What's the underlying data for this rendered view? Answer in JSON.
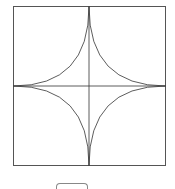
{
  "diagram": {
    "type": "astroid-in-square",
    "square": {
      "x": 13,
      "y": 6,
      "size": 153
    },
    "stroke_color": "#333333",
    "frame_color": "#555555"
  },
  "controls": {
    "partial_button_label": ""
  }
}
